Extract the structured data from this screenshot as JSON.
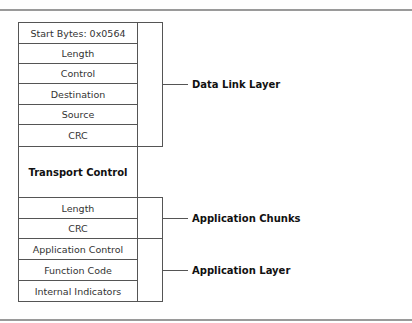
{
  "diagram": {
    "frame_fields": [
      {
        "label": "Start Bytes: 0x0564",
        "bold": false
      },
      {
        "label": "Length",
        "bold": false
      },
      {
        "label": "Control",
        "bold": false
      },
      {
        "label": "Destination",
        "bold": false
      },
      {
        "label": "Source",
        "bold": false
      },
      {
        "label": "CRC",
        "bold": false
      },
      {
        "label": "Transport Control",
        "bold": true
      },
      {
        "label": "Length",
        "bold": false
      },
      {
        "label": "CRC",
        "bold": false
      },
      {
        "label": "Application Control",
        "bold": false
      },
      {
        "label": "Function Code",
        "bold": false
      },
      {
        "label": "Internal Indicators",
        "bold": false
      }
    ],
    "groups": [
      {
        "label": "Data Link Layer",
        "spans": "Start Bytes through CRC"
      },
      {
        "label": "Application Chunks",
        "spans": "Length, CRC"
      },
      {
        "label": "Application Layer",
        "spans": "Application Control through Internal Indicators"
      }
    ],
    "colors": {
      "line": "#555555",
      "rule": "#9a9a9a",
      "background": "#ffffff"
    }
  }
}
